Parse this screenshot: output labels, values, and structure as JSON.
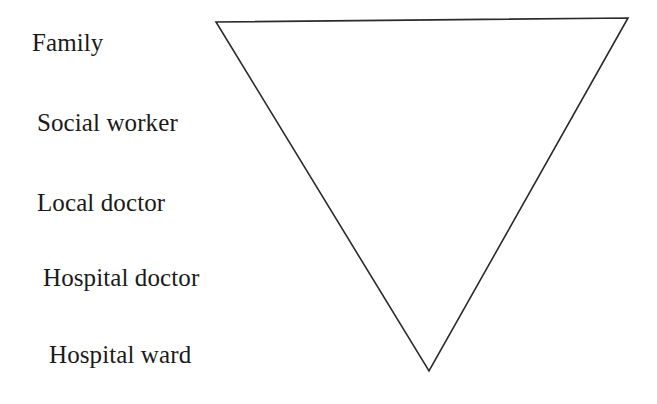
{
  "figure": {
    "background_color": "#ffffff",
    "stroke_color": "#2b2b2b",
    "text_color": "#1a1a1a",
    "labels": [
      {
        "id": "family",
        "text": "Family"
      },
      {
        "id": "social-worker",
        "text": "Social worker"
      },
      {
        "id": "local-doctor",
        "text": "Local doctor"
      },
      {
        "id": "hospital-doctor",
        "text": "Hospital doctor"
      },
      {
        "id": "hospital-ward",
        "text": "Hospital ward"
      }
    ],
    "shape": {
      "name": "inverted-triangle",
      "vertices": [
        {
          "x": 216,
          "y": 22
        },
        {
          "x": 628,
          "y": 18
        },
        {
          "x": 429,
          "y": 371
        }
      ],
      "stroke_width": 1.6,
      "fill": "none"
    }
  }
}
